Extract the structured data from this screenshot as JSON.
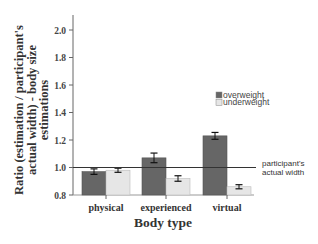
{
  "chart_data": {
    "type": "bar",
    "title": "",
    "xlabel": "Body type",
    "ylabel": "Ratio (estimation / participant's actual width) - body size estimations",
    "ylabel_lines": [
      "Ratio (estimation / participant's",
      "actual width) - body size",
      "estimations"
    ],
    "categories": [
      "physical",
      "experienced",
      "virtual"
    ],
    "series": [
      {
        "name": "overweight",
        "color": "#666666",
        "values": [
          0.97,
          1.07,
          1.23
        ],
        "errors": [
          0.02,
          0.035,
          0.025
        ]
      },
      {
        "name": "underweight",
        "color": "#e6e6e6",
        "values": [
          0.98,
          0.92,
          0.86
        ],
        "errors": [
          0.015,
          0.02,
          0.015
        ]
      }
    ],
    "ylim": [
      0.8,
      2.0
    ],
    "yticks": [
      "0.8",
      "1.0",
      "1.2",
      "1.4",
      "1.6",
      "1.8",
      "2.0"
    ],
    "reference_line": {
      "value": 1.0,
      "label_lines": [
        "participant's",
        "actual width"
      ]
    },
    "legend_position": "upper right",
    "grid": false
  }
}
